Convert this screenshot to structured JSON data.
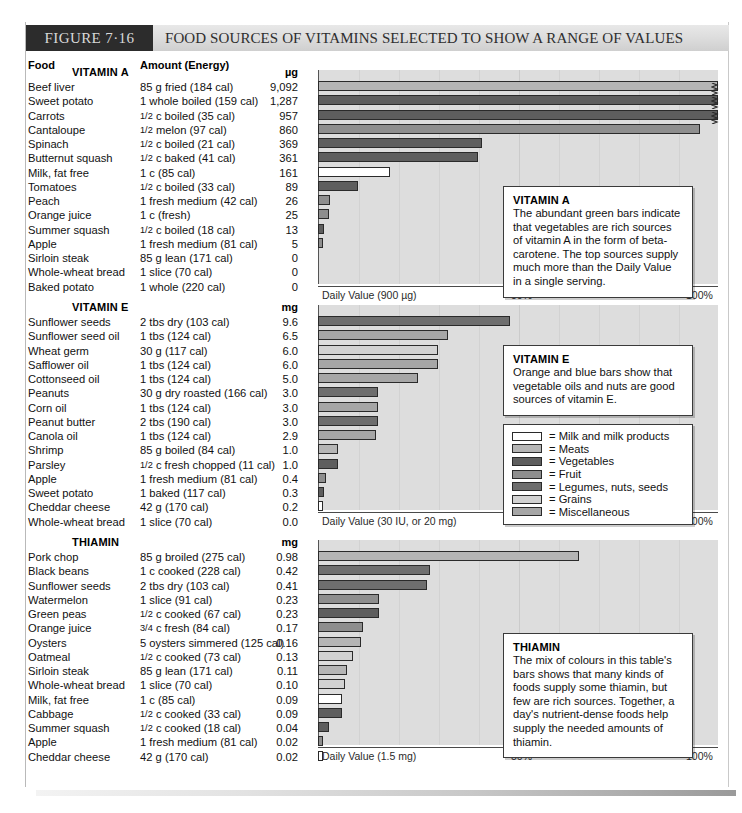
{
  "figure": {
    "tag": "FIGURE 7·16",
    "title": "FOOD SOURCES OF VITAMINS SELECTED TO SHOW A RANGE OF VALUES"
  },
  "columns": {
    "food": "Food",
    "amount": "Amount (Energy)"
  },
  "colors": {
    "milk": "#ffffff",
    "meats": "#b5b5b5",
    "vegetables": "#5e5e5e",
    "fruit": "#8e8e8e",
    "legumes": "#6e6e6e",
    "grains": "#d2d2d2",
    "misc": "#a6a6a6",
    "chart_bg": "#dddddd",
    "header_tag_bg": "#2c2c2c"
  },
  "legend": {
    "items": [
      {
        "label": "= Milk and milk products",
        "key": "milk"
      },
      {
        "label": "= Meats",
        "key": "meats"
      },
      {
        "label": "= Vegetables",
        "key": "vegetables"
      },
      {
        "label": "= Fruit",
        "key": "fruit"
      },
      {
        "label": "= Legumes, nuts, seeds",
        "key": "legumes"
      },
      {
        "label": "= Grains",
        "key": "grains"
      },
      {
        "label": "= Miscellaneous",
        "key": "misc"
      }
    ]
  },
  "axis": {
    "mid": "50%",
    "max": "100%"
  },
  "chart_data": [
    {
      "type": "bar",
      "title": "VITAMIN A",
      "unit": "µg",
      "xlabel": "Daily Value (900 µg)",
      "daily_value": 900,
      "xlim": [
        0,
        100
      ],
      "xticks": [
        "50%",
        "100%"
      ],
      "grid": true,
      "categories": [
        "Beef liver",
        "Sweet potato",
        "Carrots",
        "Cantaloupe",
        "Spinach",
        "Butternut squash",
        "Milk, fat free",
        "Tomatoes",
        "Peach",
        "Orange juice",
        "Summer squash",
        "Apple",
        "Sirloin steak",
        "Whole-wheat bread",
        "Baked potato"
      ],
      "amounts": [
        "85 g fried (184 cal)",
        "1 whole boiled (159 cal)",
        "½ c boiled (35 cal)",
        "½ melon (97 cal)",
        "½ c boiled (21 cal)",
        "½ c baked (41 cal)",
        "1 c (85 cal)",
        "½ c boiled (33 cal)",
        "1 fresh medium (42 cal)",
        "1 c (fresh)",
        "½ c boiled (18 cal)",
        "1 fresh medium (81 cal)",
        "85 g lean (171 cal)",
        "1 slice (70 cal)",
        "1 whole (220 cal)"
      ],
      "values": [
        9092,
        1287,
        957,
        860,
        369,
        361,
        161,
        89,
        26,
        25,
        13,
        5,
        0,
        0,
        0
      ],
      "value_labels": [
        "9,092",
        "1,287",
        "957",
        "860",
        "369",
        "361",
        "161",
        "89",
        "26",
        "25",
        "13",
        "5",
        "0",
        "0",
        "0"
      ],
      "percents": [
        100,
        100,
        100,
        95.5,
        41.0,
        40.1,
        17.9,
        9.9,
        2.9,
        2.8,
        1.4,
        0.6,
        0,
        0,
        0
      ],
      "groups": [
        "meats",
        "vegetables",
        "vegetables",
        "fruit",
        "vegetables",
        "vegetables",
        "milk",
        "vegetables",
        "fruit",
        "fruit",
        "vegetables",
        "fruit",
        "meats",
        "grains",
        "vegetables"
      ],
      "broken": [
        true,
        true,
        true,
        false,
        false,
        false,
        false,
        false,
        false,
        false,
        false,
        false,
        false,
        false,
        false
      ],
      "callout": {
        "title": "VITAMIN A",
        "text": "The abundant green bars indicate that vegetables are rich sources of vitamin A in the form of beta-carotene. The top sources supply much more than the Daily Value in a single serving."
      }
    },
    {
      "type": "bar",
      "title": "VITAMIN E",
      "unit": "mg",
      "xlabel": "Daily Value (30 IU, or 20 mg)",
      "daily_value": 20,
      "xlim": [
        0,
        100
      ],
      "xticks": [
        "50%",
        "100%"
      ],
      "grid": true,
      "categories": [
        "Sunflower seeds",
        "Sunflower seed oil",
        "Wheat germ",
        "Safflower oil",
        "Cottonseed oil",
        "Peanuts",
        "Corn oil",
        "Peanut butter",
        "Canola oil",
        "Shrimp",
        "Parsley",
        "Apple",
        "Sweet potato",
        "Cheddar cheese",
        "Whole-wheat bread"
      ],
      "amounts": [
        "2 tbs dry (103 cal)",
        "1 tbs (124 cal)",
        "30 g (117 cal)",
        "1 tbs (124 cal)",
        "1 tbs (124 cal)",
        "30 g dry roasted (166 cal)",
        "1 tbs (124 cal)",
        "2 tbs (190 cal)",
        "1 tbs (124 cal)",
        "85 g boiled (84 cal)",
        "½ c fresh chopped (11 cal)",
        "1 fresh medium (81 cal)",
        "1 baked (117 cal)",
        "42 g (170 cal)",
        "1 slice (70 cal)"
      ],
      "values": [
        9.6,
        6.5,
        6.0,
        6.0,
        5.0,
        3.0,
        3.0,
        3.0,
        2.9,
        1.0,
        1.0,
        0.4,
        0.3,
        0.2,
        0.0
      ],
      "value_labels": [
        "9.6",
        "6.5",
        "6.0",
        "6.0",
        "5.0",
        "3.0",
        "3.0",
        "3.0",
        "2.9",
        "1.0",
        "1.0",
        "0.4",
        "0.3",
        "0.2",
        "0.0"
      ],
      "percents": [
        48,
        32.5,
        30,
        30,
        25,
        15,
        15,
        15,
        14.5,
        5,
        5,
        2,
        1.5,
        1,
        0
      ],
      "groups": [
        "legumes",
        "misc",
        "grains",
        "misc",
        "misc",
        "legumes",
        "misc",
        "legumes",
        "misc",
        "meats",
        "vegetables",
        "fruit",
        "vegetables",
        "milk",
        "grains"
      ],
      "broken": [
        false,
        false,
        false,
        false,
        false,
        false,
        false,
        false,
        false,
        false,
        false,
        false,
        false,
        false,
        false
      ],
      "callout": {
        "title": "VITAMIN E",
        "text": "Orange and blue bars show that vegetable oils and nuts are good sources of vitamin E."
      }
    },
    {
      "type": "bar",
      "title": "THIAMIN",
      "unit": "mg",
      "xlabel": "Daily Value (1.5 mg)",
      "daily_value": 1.5,
      "xlim": [
        0,
        100
      ],
      "xticks": [
        "50%",
        "100%"
      ],
      "grid": true,
      "categories": [
        "Pork chop",
        "Black beans",
        "Sunflower seeds",
        "Watermelon",
        "Green peas",
        "Orange juice",
        "Oysters",
        "Oatmeal",
        "Sirloin steak",
        "Whole-wheat bread",
        "Milk, fat free",
        "Cabbage",
        "Summer squash",
        "Apple",
        "Cheddar cheese"
      ],
      "amounts": [
        "85 g broiled  (275 cal)",
        "1 c cooked (228 cal)",
        "2 tbs dry (103 cal)",
        "1 slice (91 cal)",
        "½ c cooked (67 cal)",
        "¾ c fresh (84 cal)",
        "5 oysters simmered (125 cal)",
        "½ c cooked (73 cal)",
        "85 g lean (171 cal)",
        "1 slice (70 cal)",
        "1 c (85 cal)",
        "½ c cooked (33 cal)",
        "½ c cooked (18 cal)",
        "1 fresh medium (81 cal)",
        "42 g (170 cal)"
      ],
      "values": [
        0.98,
        0.42,
        0.41,
        0.23,
        0.23,
        0.17,
        0.16,
        0.13,
        0.11,
        0.1,
        0.09,
        0.09,
        0.04,
        0.02,
        0.02
      ],
      "value_labels": [
        "0.98",
        "0.42",
        "0.41",
        "0.23",
        "0.23",
        "0.17",
        "0.16",
        "0.13",
        "0.11",
        "0.10",
        "0.09",
        "0.09",
        "0.04",
        "0.02",
        "0.02"
      ],
      "percents": [
        65.3,
        28,
        27.3,
        15.3,
        15.3,
        11.3,
        10.7,
        8.7,
        7.3,
        6.7,
        6,
        6,
        2.7,
        1.3,
        1.3
      ],
      "groups": [
        "meats",
        "legumes",
        "legumes",
        "fruit",
        "vegetables",
        "fruit",
        "meats",
        "grains",
        "meats",
        "grains",
        "milk",
        "vegetables",
        "vegetables",
        "fruit",
        "milk"
      ],
      "broken": [
        false,
        false,
        false,
        false,
        false,
        false,
        false,
        false,
        false,
        false,
        false,
        false,
        false,
        false,
        false
      ],
      "callout": {
        "title": "THIAMIN",
        "text": "The mix of colours in this table's bars shows that many kinds of foods supply some thiamin, but few are rich sources. Together, a day's nutrient-dense foods help supply the needed amounts of thiamin."
      }
    }
  ]
}
